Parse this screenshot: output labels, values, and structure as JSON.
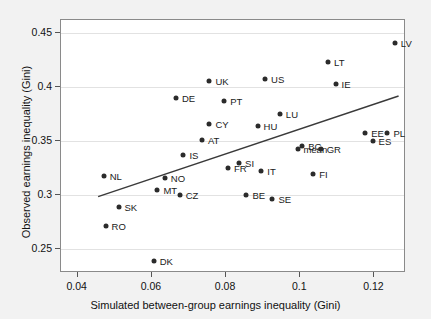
{
  "chart_data": {
    "type": "scatter",
    "title": "",
    "xlabel": "Simulated between-group earnings inequality (Gini)",
    "ylabel": "Observed earnings inequality (Gini)",
    "xlim": [
      0.0355,
      0.1285
    ],
    "ylim": [
      0.228,
      0.4617
    ],
    "xticks": [
      0.04,
      0.06,
      0.08,
      0.1,
      0.12
    ],
    "xticklabels": [
      "0.04",
      "0.06",
      "0.08",
      "0.1",
      "0.12"
    ],
    "yticks": [
      0.25,
      0.3,
      0.35,
      0.4,
      0.45
    ],
    "yticklabels": [
      "0.25",
      "0.3",
      "0.35",
      "0.4",
      "0.45"
    ],
    "grid": "horizontal",
    "legend": "none",
    "marker_color": "#2b2b2b",
    "trendline_color": "#3a3a3a",
    "trendline": {
      "x0": 0.0455,
      "y0": 0.2985,
      "x1": 0.1265,
      "y1": 0.3915
    },
    "points": [
      {
        "label": "LV",
        "x": 0.1255,
        "y": 0.44,
        "lx": 6,
        "ly": 0
      },
      {
        "label": "LT",
        "x": 0.1075,
        "y": 0.423,
        "lx": 6,
        "ly": 0
      },
      {
        "label": "IE",
        "x": 0.1095,
        "y": 0.403,
        "lx": 6,
        "ly": 0
      },
      {
        "label": "US",
        "x": 0.0905,
        "y": 0.407,
        "lx": 6,
        "ly": 0
      },
      {
        "label": "UK",
        "x": 0.0755,
        "y": 0.405,
        "lx": 6,
        "ly": 0
      },
      {
        "label": "DE",
        "x": 0.0665,
        "y": 0.39,
        "lx": 6,
        "ly": 0
      },
      {
        "label": "PT",
        "x": 0.0795,
        "y": 0.387,
        "lx": 6,
        "ly": 0
      },
      {
        "label": "LU",
        "x": 0.0945,
        "y": 0.375,
        "lx": 6,
        "ly": 0
      },
      {
        "label": "CY",
        "x": 0.0755,
        "y": 0.366,
        "lx": 6,
        "ly": 0
      },
      {
        "label": "HU",
        "x": 0.0885,
        "y": 0.364,
        "lx": 6,
        "ly": 0
      },
      {
        "label": "EE",
        "x": 0.1175,
        "y": 0.357,
        "lx": 6,
        "ly": 0
      },
      {
        "label": "PL",
        "x": 0.1235,
        "y": 0.357,
        "lx": 6,
        "ly": 0
      },
      {
        "label": "AT",
        "x": 0.0735,
        "y": 0.351,
        "lx": 6,
        "ly": 0
      },
      {
        "label": "ES",
        "x": 0.1195,
        "y": 0.35,
        "lx": 6,
        "ly": 0
      },
      {
        "label": "BG",
        "x": 0.1005,
        "y": 0.3455,
        "lx": 6,
        "ly": 0
      },
      {
        "label": "mean",
        "x": 0.0995,
        "y": 0.343,
        "lx": 5,
        "ly": 0
      },
      {
        "label": "GR",
        "x": 0.1055,
        "y": 0.343,
        "lx": 6,
        "ly": 0
      },
      {
        "label": "IS",
        "x": 0.0685,
        "y": 0.337,
        "lx": 6,
        "ly": 0
      },
      {
        "label": "SI",
        "x": 0.0835,
        "y": 0.33,
        "lx": 6,
        "ly": 0
      },
      {
        "label": "FR",
        "x": 0.0805,
        "y": 0.325,
        "lx": 6,
        "ly": 0
      },
      {
        "label": "IT",
        "x": 0.0895,
        "y": 0.322,
        "lx": 6,
        "ly": 0
      },
      {
        "label": "FI",
        "x": 0.1035,
        "y": 0.319,
        "lx": 6,
        "ly": 0
      },
      {
        "label": "NL",
        "x": 0.047,
        "y": 0.318,
        "lx": 6,
        "ly": 0
      },
      {
        "label": "NO",
        "x": 0.0635,
        "y": 0.316,
        "lx": 6,
        "ly": 0
      },
      {
        "label": "MT",
        "x": 0.0615,
        "y": 0.305,
        "lx": 6,
        "ly": 0
      },
      {
        "label": "CZ",
        "x": 0.0675,
        "y": 0.3,
        "lx": 6,
        "ly": 0
      },
      {
        "label": "BE",
        "x": 0.0855,
        "y": 0.3,
        "lx": 6,
        "ly": 0
      },
      {
        "label": "SE",
        "x": 0.0925,
        "y": 0.296,
        "lx": 6,
        "ly": 0
      },
      {
        "label": "SK",
        "x": 0.051,
        "y": 0.289,
        "lx": 6,
        "ly": 0
      },
      {
        "label": "RO",
        "x": 0.0475,
        "y": 0.271,
        "lx": 6,
        "ly": 0
      },
      {
        "label": "DK",
        "x": 0.0605,
        "y": 0.239,
        "lx": 6,
        "ly": 0
      }
    ]
  }
}
